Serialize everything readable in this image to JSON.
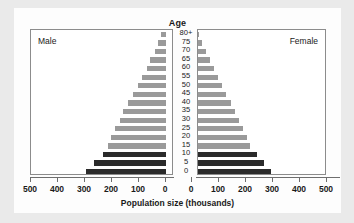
{
  "chart_data": {
    "type": "bar",
    "title": "Age",
    "subtitle": "",
    "xlabel": "Population size (thousands)",
    "ylabel": "Age",
    "orientation": "horizontal-diverging",
    "layout": "population-pyramid",
    "grid": false,
    "legend_position": "in-plot-corners",
    "xlim_left": [
      500,
      0
    ],
    "xlim_right": [
      0,
      500
    ],
    "xticks_left": [
      "500",
      "400",
      "300",
      "200",
      "100",
      "0"
    ],
    "xticks_right": [
      "0",
      "100",
      "200",
      "300",
      "400",
      "500"
    ],
    "categories": [
      "80+",
      "75",
      "70",
      "65",
      "60",
      "55",
      "50",
      "45",
      "40",
      "35",
      "30",
      "25",
      "20",
      "15",
      "10",
      "5",
      "0"
    ],
    "side_labels": {
      "left": "Male",
      "right": "Female"
    },
    "series": [
      {
        "name": "Male",
        "side": "left",
        "values": [
          18,
          28,
          42,
          58,
          72,
          88,
          105,
          122,
          140,
          158,
          172,
          188,
          205,
          215,
          235,
          265,
          295
        ]
      },
      {
        "name": "Female",
        "side": "right",
        "values": [
          26,
          38,
          52,
          66,
          80,
          95,
          110,
          126,
          144,
          160,
          175,
          190,
          205,
          215,
          240,
          265,
          292
        ]
      }
    ],
    "bar_colors": {
      "children": "#2b2b2b",
      "adults": "#9a9a9a"
    },
    "dark_categories": [
      "10",
      "5",
      "0"
    ],
    "colors": {
      "figure_background": "#eaeaea",
      "plot_background": "#ffffff",
      "axis": "#6e6e6e",
      "frame": "#8c8c8c",
      "text": "#1a1a1a"
    }
  }
}
